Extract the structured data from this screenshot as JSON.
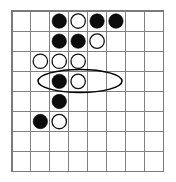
{
  "figure": {
    "type": "grid-board-diagram"
  },
  "board": {
    "columns": 8,
    "rows": 8,
    "column_labels": [
      "1",
      "2",
      "3",
      "4",
      "5",
      "6",
      "7",
      "8"
    ],
    "row_labels": [
      "1",
      "2",
      "3",
      "4",
      "5",
      "6",
      "7",
      "8"
    ],
    "grid_line_color": "#808080",
    "border_color": "#7a7a7a",
    "background_color": "#ffffff",
    "geometry": {
      "origin_x": 12,
      "origin_y": 11,
      "cell_width": 18.9,
      "cell_height": 20.1,
      "stone_radius": 7.2
    }
  },
  "stones": [
    {
      "id": "stone-r1c3",
      "row": 1,
      "col": 3,
      "color": "black",
      "color_hex": "#0c0c0c"
    },
    {
      "id": "stone-r1c4",
      "row": 1,
      "col": 4,
      "color": "white",
      "color_hex": "#ffffff"
    },
    {
      "id": "stone-r1c5",
      "row": 1,
      "col": 5,
      "color": "black",
      "color_hex": "#0c0c0c"
    },
    {
      "id": "stone-r1c6",
      "row": 1,
      "col": 6,
      "color": "black",
      "color_hex": "#0c0c0c"
    },
    {
      "id": "stone-r2c3",
      "row": 2,
      "col": 3,
      "color": "black",
      "color_hex": "#0c0c0c"
    },
    {
      "id": "stone-r2c4",
      "row": 2,
      "col": 4,
      "color": "black",
      "color_hex": "#0c0c0c"
    },
    {
      "id": "stone-r2c5",
      "row": 2,
      "col": 5,
      "color": "white",
      "color_hex": "#ffffff"
    },
    {
      "id": "stone-r3c2",
      "row": 3,
      "col": 2,
      "color": "white",
      "color_hex": "#ffffff"
    },
    {
      "id": "stone-r3c3",
      "row": 3,
      "col": 3,
      "color": "white",
      "color_hex": "#ffffff"
    },
    {
      "id": "stone-r3c4",
      "row": 3,
      "col": 4,
      "color": "white",
      "color_hex": "#ffffff"
    },
    {
      "id": "stone-r4c3",
      "row": 4,
      "col": 3,
      "color": "black",
      "color_hex": "#0c0c0c"
    },
    {
      "id": "stone-r4c4",
      "row": 4,
      "col": 4,
      "color": "white",
      "color_hex": "#ffffff"
    },
    {
      "id": "stone-r5c3",
      "row": 5,
      "col": 3,
      "color": "black",
      "color_hex": "#0c0c0c"
    },
    {
      "id": "stone-r6c2",
      "row": 6,
      "col": 2,
      "color": "black",
      "color_hex": "#0c0c0c"
    },
    {
      "id": "stone-r6c3",
      "row": 6,
      "col": 3,
      "color": "white",
      "color_hex": "#ffffff"
    }
  ],
  "annotations": [
    {
      "id": "highlight-oval",
      "shape": "ellipse",
      "covers_row": 3,
      "covers_columns": [
        2,
        3,
        4
      ],
      "center_x": 80,
      "center_y": 81,
      "radius_x": 42,
      "radius_y": 11.5,
      "stroke_color": "#000000"
    }
  ],
  "legend": {
    "black_label": "black stone",
    "white_label": "white stone",
    "highlight_label": "highlighted group"
  }
}
